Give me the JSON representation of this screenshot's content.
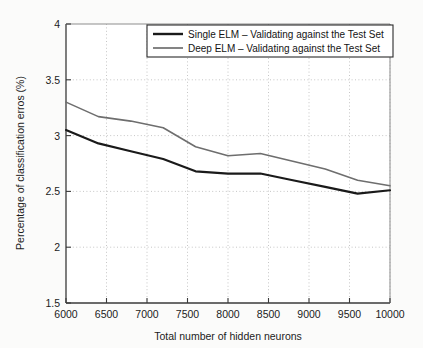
{
  "chart_data": {
    "type": "line",
    "title": "",
    "xlabel": "Total number of hidden neurons",
    "ylabel": "Percentage of classification erros (%)",
    "xlim": [
      6000,
      10000
    ],
    "ylim": [
      1.5,
      4
    ],
    "xticks": [
      6000,
      6500,
      7000,
      7500,
      8000,
      8500,
      9000,
      9500,
      10000
    ],
    "xtick_labels": [
      "6000",
      "6500",
      "7000",
      "7500",
      "8000",
      "8500",
      "9000",
      "9500",
      "10000"
    ],
    "yticks": [
      1.5,
      2,
      2.5,
      3,
      3.5,
      4
    ],
    "ytick_labels": [
      "1.5",
      "2",
      "2.5",
      "3",
      "3.5",
      "4"
    ],
    "grid": true,
    "grid_style": "dotted",
    "legend_position": "top",
    "x": [
      6000,
      6400,
      6800,
      7200,
      7600,
      8000,
      8400,
      8800,
      9200,
      9600,
      10000
    ],
    "series": [
      {
        "name": "Single ELM – Validating against the Test Set",
        "color": "#1a1a1a",
        "width": 2.2,
        "values": [
          3.05,
          2.93,
          2.86,
          2.79,
          2.68,
          2.66,
          2.66,
          2.6,
          2.54,
          2.48,
          2.51
        ]
      },
      {
        "name": "Deep ELM – Validating against the Test Set",
        "color": "#6e6e6e",
        "width": 1.6,
        "values": [
          3.3,
          3.17,
          3.13,
          3.07,
          2.9,
          2.82,
          2.84,
          2.77,
          2.7,
          2.6,
          2.55
        ]
      }
    ]
  },
  "legend": {
    "items": [
      {
        "label": "Single ELM – Validating against the Test Set"
      },
      {
        "label": "Deep ELM – Validating against the Test Set"
      }
    ]
  },
  "axes": {
    "x_title": "Total number of hidden neurons",
    "y_title": "Percentage of classification erros (%)"
  },
  "colors": {
    "series_single": "#1a1a1a",
    "series_deep": "#6e6e6e",
    "axis": "#3a3a3a",
    "grid": "#b8b8b8",
    "background": "#fbfbfa"
  }
}
